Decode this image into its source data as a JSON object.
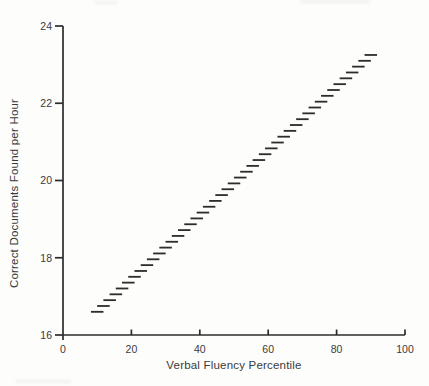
{
  "figure": {
    "background": "#fdfdfc",
    "ink_color": "#2c2c2c",
    "label_color": "#3a3a3a"
  },
  "chart_data": {
    "type": "line",
    "xlabel": "Verbal Fluency Percentile",
    "ylabel": "Correct Documents Found per Hour",
    "xlim": [
      0,
      100
    ],
    "ylim": [
      16,
      24
    ],
    "xticks": [
      0,
      20,
      40,
      60,
      80,
      100
    ],
    "yticks": [
      16,
      18,
      20,
      22,
      24
    ],
    "grid": false,
    "legend_position": "none",
    "series": [
      {
        "name": "expectancy-line",
        "style": "dashed",
        "dash_count": 45,
        "x": [
          10,
          20,
          30,
          40,
          50,
          60,
          70,
          80,
          90
        ],
        "y": [
          16.6,
          17.43,
          18.26,
          19.09,
          19.93,
          20.76,
          21.59,
          22.42,
          23.25
        ]
      }
    ]
  }
}
